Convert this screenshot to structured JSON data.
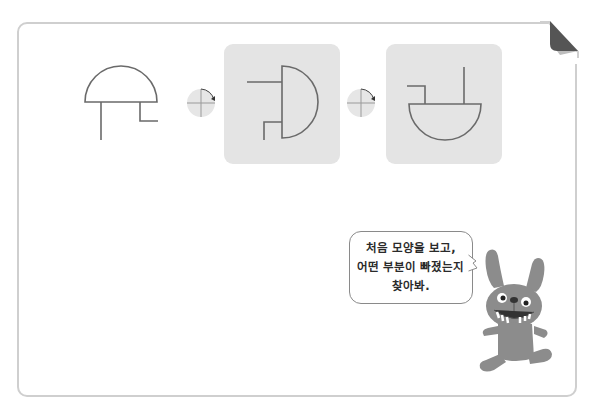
{
  "instruction_bubble": {
    "lines": [
      "처음 모양을 보고,",
      "어떤 부분이 빠졌는지",
      "찾아봐."
    ]
  },
  "puzzle": {
    "step_1": {
      "shape": "dome-with-stem-and-notch",
      "rotation_deg": 0,
      "highlighted": false
    },
    "rotation_1": {
      "icon": "rotate-quarter-clockwise-icon",
      "angle_deg": 90
    },
    "step_2": {
      "shape": "dome-rotated-90",
      "rotation_deg": 90,
      "highlighted": true
    },
    "rotation_2": {
      "icon": "rotate-quarter-clockwise-icon",
      "angle_deg": 90
    },
    "step_3": {
      "shape": "dome-rotated-180-missing-part",
      "rotation_deg": 180,
      "highlighted": true
    }
  },
  "colors": {
    "frame_border": "#cfcfcf",
    "panel_bg": "#e4e4e4",
    "line": "#6a6a6a",
    "fold": "#555555",
    "character": "#8c8c8c"
  },
  "character": {
    "name": "bunny-mascot"
  }
}
